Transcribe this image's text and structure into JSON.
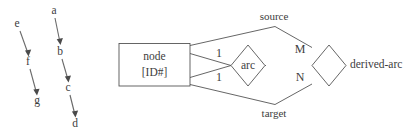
{
  "diagram": {
    "stroke_color": "#555555",
    "text_color": "#3d3d3d",
    "background_color": "#ffffff",
    "entities": [
      {
        "id": "node",
        "kind": "entity-rectangle",
        "line1": "node",
        "line2": "[ID#]"
      },
      {
        "id": "derived-arc",
        "kind": "entity-label",
        "label": "derived-arc"
      }
    ],
    "relationships": [
      {
        "id": "arc",
        "kind": "relationship-diamond",
        "label": "arc"
      },
      {
        "id": "derived",
        "kind": "relationship-diamond",
        "label": ""
      }
    ],
    "roles": [
      {
        "id": "source",
        "label": "source"
      },
      {
        "id": "target",
        "label": "target"
      }
    ],
    "cardinalities": [
      {
        "id": "arc-source-card",
        "label": "1"
      },
      {
        "id": "arc-target-card",
        "label": "1"
      },
      {
        "id": "derived-m-card",
        "label": "M"
      },
      {
        "id": "derived-n-card",
        "label": "N"
      }
    ]
  },
  "graphs": [
    {
      "id": "chain-left",
      "nodes": [
        {
          "label": "e",
          "x": 17,
          "y": 24
        },
        {
          "label": "f",
          "x": 28,
          "y": 62
        },
        {
          "label": "g",
          "x": 37,
          "y": 101
        }
      ],
      "edges": [
        {
          "from": "e",
          "to": "f"
        },
        {
          "from": "f",
          "to": "g"
        }
      ]
    },
    {
      "id": "chain-middle",
      "nodes": [
        {
          "label": "a",
          "x": 54,
          "y": 11
        },
        {
          "label": "b",
          "x": 60,
          "y": 52
        },
        {
          "label": "c",
          "x": 68,
          "y": 88
        },
        {
          "label": "d",
          "x": 75,
          "y": 124
        }
      ],
      "edges": [
        {
          "from": "a",
          "to": "b"
        },
        {
          "from": "b",
          "to": "c"
        },
        {
          "from": "c",
          "to": "d"
        }
      ]
    }
  ]
}
